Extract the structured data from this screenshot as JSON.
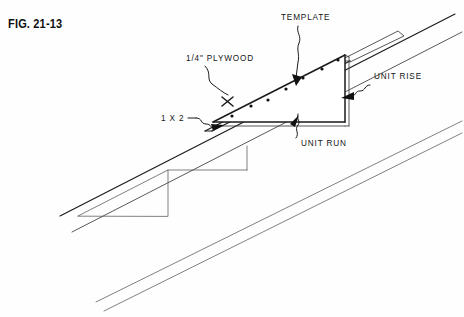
{
  "figure": {
    "caption": "FIG. 21-13",
    "background_color": "#fefefe",
    "ink_color": "#1a1a1a"
  },
  "labels": [
    {
      "id": "template",
      "text": "TEMPLATE",
      "x": 281,
      "y": 18,
      "leader": "wavy-vertical"
    },
    {
      "id": "plywood",
      "text": "1/4\" PLYWOOD",
      "x": 186,
      "y": 59,
      "leader": "wavy-diagonal"
    },
    {
      "id": "one-by-two",
      "text": "1 X 2",
      "x": 161,
      "y": 121,
      "leader": "squiggle-arrow"
    },
    {
      "id": "unit-rise",
      "text": "UNIT RISE",
      "x": 374,
      "y": 76,
      "leader": "wavy-arrow-left"
    },
    {
      "id": "unit-run",
      "text": "UNIT RUN",
      "x": 301,
      "y": 143,
      "leader": "wavy-arrow-up"
    }
  ],
  "geometry": {
    "rafter_top_edge": {
      "x1": 60,
      "y1": 216,
      "x2": 455,
      "y2": 14
    },
    "rafter_second_edge": {
      "x1": 72,
      "y1": 232,
      "x2": 462,
      "y2": 32
    },
    "rafter_lower_a": {
      "x1": 98,
      "y1": 303,
      "x2": 462,
      "y2": 122
    },
    "rafter_lower_b": {
      "x1": 104,
      "y1": 311,
      "x2": 462,
      "y2": 133
    },
    "template_triangle": [
      [
        213,
        122
      ],
      [
        345,
        55
      ],
      [
        345,
        122
      ]
    ],
    "ghost_triangle": [
      [
        78,
        216
      ],
      [
        168,
        170
      ],
      [
        168,
        216
      ]
    ],
    "cleat_thickness": 7,
    "nail_count": 6
  },
  "nails": [
    {
      "x": 232,
      "y": 115
    },
    {
      "x": 249,
      "y": 106
    },
    {
      "x": 265,
      "y": 98
    },
    {
      "x": 281,
      "y": 90
    },
    {
      "x": 298,
      "y": 81
    },
    {
      "x": 314,
      "y": 73
    },
    {
      "x": 331,
      "y": 64
    }
  ]
}
